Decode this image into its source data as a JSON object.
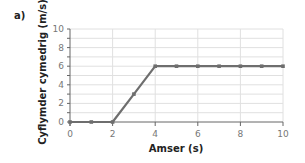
{
  "panel_label": "a)",
  "chart_data": {
    "type": "line",
    "title": "",
    "xlabel": "Amser (s)",
    "ylabel": "Cyflymder cymedrig (m/s)",
    "x": [
      0,
      1,
      2,
      3,
      4,
      5,
      6,
      7,
      8,
      9,
      10
    ],
    "series": [
      {
        "name": "speed",
        "values": [
          0,
          0,
          0,
          3,
          6,
          6,
          6,
          6,
          6,
          6,
          6
        ]
      }
    ],
    "xlim": [
      0,
      10
    ],
    "ylim": [
      0,
      10
    ],
    "xticks": [
      0,
      2,
      4,
      6,
      8,
      10
    ],
    "yticks": [
      0,
      2,
      4,
      6,
      8,
      10
    ],
    "grid": true,
    "legend": "none",
    "line_color": "#6e6e6e",
    "grid_color": "#e0e0e0"
  }
}
